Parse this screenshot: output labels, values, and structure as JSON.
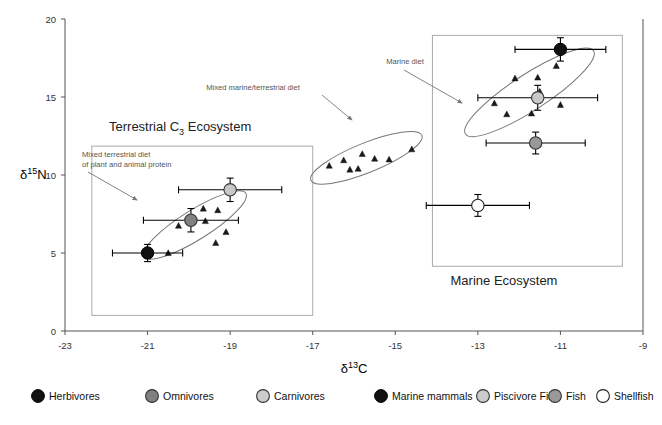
{
  "chart_data": {
    "type": "scatter",
    "title": "",
    "xlabel": "δ13C",
    "ylabel": "δ15N",
    "xlim": [
      -23,
      -9
    ],
    "ylim": [
      0,
      20
    ],
    "xticks": [
      -23,
      -21,
      -19,
      -17,
      -15,
      -13,
      -11,
      -9
    ],
    "xtick_labels": [
      "-23",
      "-21",
      "-19",
      "-17",
      "-15",
      "-13",
      "-11",
      "-9"
    ],
    "yticks": [
      0,
      5,
      10,
      15,
      20
    ],
    "ytick_labels": [
      "0",
      "5",
      "10",
      "15",
      "20"
    ],
    "grid": false,
    "legend_position": "bottom",
    "series": [
      {
        "name": "Herbivores",
        "marker": "filled-circle",
        "color": "#111111",
        "points": [
          {
            "x": -21.0,
            "y": 5.0,
            "xerr": 0.85,
            "yerr": 0.55
          }
        ]
      },
      {
        "name": "Omnivores",
        "marker": "grey-circle",
        "color": "#808080",
        "points": [
          {
            "x": -19.95,
            "y": 7.1,
            "xerr": 1.15,
            "yerr": 0.75
          }
        ]
      },
      {
        "name": "Carnivores",
        "marker": "light-grey-circle",
        "color": "#c8c8c8",
        "points": [
          {
            "x": -19.0,
            "y": 9.05,
            "xerr": 1.25,
            "yerr": 0.75
          }
        ]
      },
      {
        "name": "Marine mammals",
        "marker": "filled-circle",
        "color": "#111111",
        "points": [
          {
            "x": -11.0,
            "y": 18.05,
            "xerr": 1.1,
            "yerr": 0.75
          }
        ]
      },
      {
        "name": "Piscivore Fish",
        "marker": "light-grey-circle",
        "color": "#c8c8c8",
        "points": [
          {
            "x": -11.55,
            "y": 14.95,
            "xerr": 1.45,
            "yerr": 0.8
          }
        ]
      },
      {
        "name": "Fish",
        "marker": "grey-circle",
        "color": "#999999",
        "points": [
          {
            "x": -11.6,
            "y": 12.05,
            "xerr": 1.2,
            "yerr": 0.7
          }
        ]
      },
      {
        "name": "Shellfish",
        "marker": "open-circle",
        "color": "#ffffff",
        "points": [
          {
            "x": -13.0,
            "y": 8.05,
            "xerr": 1.25,
            "yerr": 0.7
          }
        ]
      },
      {
        "name": "Terrestrial individuals",
        "marker": "triangle",
        "color": "#1a1a1a",
        "points": [
          {
            "x": -20.25,
            "y": 6.75
          },
          {
            "x": -19.95,
            "y": 6.95
          },
          {
            "x": -19.65,
            "y": 7.85
          },
          {
            "x": -19.6,
            "y": 7.05
          },
          {
            "x": -19.35,
            "y": 5.65
          },
          {
            "x": -19.3,
            "y": 7.75
          },
          {
            "x": -19.1,
            "y": 6.35
          },
          {
            "x": -20.5,
            "y": 5.0
          }
        ]
      },
      {
        "name": "Mixed marine/terrestrial individuals",
        "marker": "triangle",
        "color": "#1a1a1a",
        "points": [
          {
            "x": -16.6,
            "y": 10.6
          },
          {
            "x": -16.25,
            "y": 10.95
          },
          {
            "x": -16.1,
            "y": 10.35
          },
          {
            "x": -15.9,
            "y": 10.4
          },
          {
            "x": -15.8,
            "y": 11.35
          },
          {
            "x": -15.5,
            "y": 11.05
          },
          {
            "x": -15.15,
            "y": 11.0
          },
          {
            "x": -14.6,
            "y": 11.65
          }
        ]
      },
      {
        "name": "Marine individuals",
        "marker": "triangle",
        "color": "#1a1a1a",
        "points": [
          {
            "x": -11.1,
            "y": 17.0
          },
          {
            "x": -12.1,
            "y": 16.2
          },
          {
            "x": -11.55,
            "y": 16.25
          },
          {
            "x": -11.5,
            "y": 15.35
          },
          {
            "x": -12.6,
            "y": 14.6
          },
          {
            "x": -11.0,
            "y": 14.5
          },
          {
            "x": -12.3,
            "y": 13.9
          },
          {
            "x": -11.7,
            "y": 13.95
          },
          {
            "x": -11.6,
            "y": 14.95
          }
        ]
      }
    ],
    "ellipses": [
      {
        "label": "terrestrial-cluster",
        "cx": -19.85,
        "cy": 6.8,
        "rx": 1.45,
        "ry": 0.95,
        "rotation": -32
      },
      {
        "label": "mixed-cluster",
        "cx": -15.7,
        "cy": 11.1,
        "rx": 1.45,
        "ry": 0.95,
        "rotation": -22
      },
      {
        "label": "marine-cluster",
        "cx": -11.75,
        "cy": 15.3,
        "rx": 1.85,
        "ry": 1.15,
        "rotation": -33
      }
    ],
    "group_boxes": [
      {
        "label": "Terrestrial C3 Ecosystem",
        "x0": -22.35,
        "y0": 1.0,
        "x1": -17.0,
        "y1": 11.85
      },
      {
        "label": "Marine Ecosystem",
        "x0": -14.1,
        "y0": 4.15,
        "x1": -9.5,
        "y1": 18.95
      }
    ],
    "annotations": [
      {
        "text_lines": [
          "Mixed terrestrial diet",
          "of plant and animal protein"
        ],
        "label": "mixed-terrestrial-diet-annotation"
      },
      {
        "text_lines": [
          "Mixed marine/terrestrial diet"
        ],
        "label": "mixed-marine-terrestrial-diet-annotation"
      },
      {
        "text_lines": [
          "Marine diet"
        ],
        "label": "marine-diet-annotation"
      }
    ]
  },
  "axes": {
    "x_title_main": "δ",
    "x_title_sup": "13",
    "x_title_elem": "C",
    "y_title_main": "δ",
    "y_title_sup": "15",
    "y_title_elem": "N"
  },
  "ecosystems": {
    "terrestrial": {
      "label_part1": "Terrestrial C",
      "label_sub": "3",
      "label_part2": "Ecosystem"
    },
    "marine": {
      "label": "Marine Ecosystem"
    }
  },
  "annotations": {
    "mixed_terrestrial_line1": "Mixed terrestrial diet",
    "mixed_terrestrial_line2": "of plant and animal protein",
    "mixed_marine_terrestrial": "Mixed marine/terrestrial diet",
    "marine_diet": "Marine diet"
  },
  "legend": {
    "items": [
      {
        "label": "Herbivores",
        "marker": "filled-circle",
        "color": "#111111"
      },
      {
        "label": "Omnivores",
        "marker": "grey-circle",
        "color": "#808080"
      },
      {
        "label": "Carnivores",
        "marker": "light-grey-circle",
        "color": "#cccccc"
      },
      {
        "label": "Marine mammals",
        "marker": "filled-circle",
        "color": "#111111"
      },
      {
        "label": "Piscivore Fish",
        "marker": "light-grey-circle",
        "color": "#cccccc"
      },
      {
        "label": "Fish",
        "marker": "grey-circle",
        "color": "#999999"
      },
      {
        "label": "Shellfish",
        "marker": "open-circle",
        "color": "#ffffff"
      }
    ]
  },
  "ticks": {
    "x": [
      "-23",
      "-21",
      "-19",
      "-17",
      "-15",
      "-13",
      "-11",
      "-9"
    ],
    "y": [
      "0",
      "5",
      "10",
      "15",
      "20"
    ]
  }
}
